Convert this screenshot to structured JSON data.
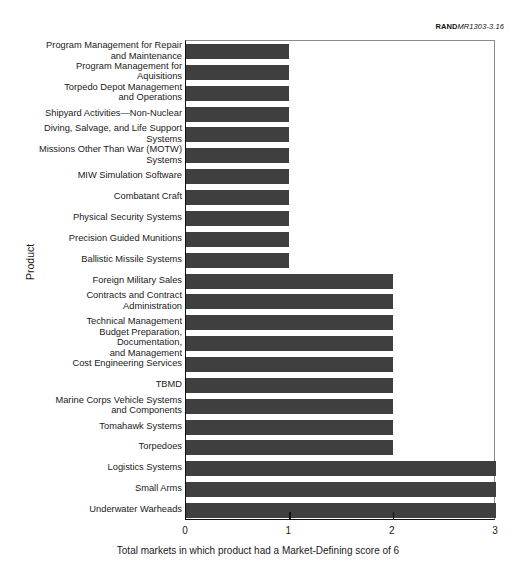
{
  "source_credit": {
    "mark": "RAND",
    "doc_id": "MR1303-3.16"
  },
  "chart_data": {
    "type": "bar",
    "orientation": "horizontal",
    "title": "",
    "xlabel": "Total markets in which product had a Market-Defining score of 6",
    "ylabel": "Product",
    "xlim": [
      0,
      3
    ],
    "xticks": [
      "0",
      "1",
      "2",
      "3"
    ],
    "grid": false,
    "legend": null,
    "bar_color": "#3f3f3f",
    "categories": [
      "Program Management for Repair\nand Maintenance",
      "Program Management for Aquisitions",
      "Torpedo Depot Management\nand Operations",
      "Shipyard Activities—Non-Nuclear",
      "Diving, Salvage, and Life Support\nSystems",
      "Missions Other Than War (MOTW)\nSystems",
      "MIW Simulation Software",
      "Combatant Craft",
      "Physical Security Systems",
      "Precision Guided Munitions",
      "Ballistic Missile Systems",
      "Foreign Military Sales",
      "Contracts and Contract\nAdministration",
      "Technical Management",
      "Budget Preparation, Documentation,\nand Management",
      "Cost Engineering Services",
      "TBMD",
      "Marine Corps Vehicle Systems\nand Components",
      "Tomahawk Systems",
      "Torpedoes",
      "Logistics Systems",
      "Small Arms",
      "Underwater Warheads"
    ],
    "values": [
      1,
      1,
      1,
      1,
      1,
      1,
      1,
      1,
      1,
      1,
      1,
      2,
      2,
      2,
      2,
      2,
      2,
      2,
      2,
      2,
      3,
      3,
      3
    ]
  }
}
